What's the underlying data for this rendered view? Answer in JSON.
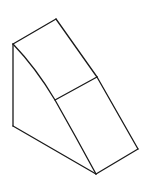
{
  "figure": {
    "stroke_color": "#1a1a1a",
    "background_color": "#ffffff",
    "vertices": {
      "top_left": [
        13,
        44
      ],
      "top_back": [
        56,
        19
      ],
      "mid_right": [
        97,
        77
      ],
      "mid_left": [
        55,
        100
      ],
      "bottom_left": [
        13,
        126
      ],
      "bottom_front": [
        96,
        174
      ],
      "right_front": [
        138,
        149
      ]
    }
  }
}
